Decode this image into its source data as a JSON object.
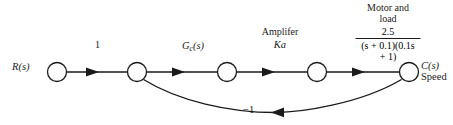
{
  "figure": {
    "type": "signal-flow-graph",
    "background_color": "#ffffff",
    "line_color": "#1a1a1a",
    "width": 453,
    "height": 125
  },
  "nodes": [
    {
      "id": "input",
      "label": "R(s)",
      "cx": 57,
      "cy": 72,
      "r": 9.5
    },
    {
      "id": "summing",
      "label": "",
      "cx": 137,
      "cy": 72,
      "r": 9.5
    },
    {
      "id": "controller",
      "label": "",
      "cx": 227,
      "cy": 72,
      "r": 9.5
    },
    {
      "id": "amplifier",
      "label": "",
      "cx": 317,
      "cy": 72,
      "r": 9.5
    },
    {
      "id": "output",
      "label": "C(s)",
      "cx": 409,
      "cy": 72,
      "r": 9.5
    }
  ],
  "labels": {
    "input": "R(s)",
    "output": "C(s)",
    "output_sub": "Speed",
    "gain_unity": "1",
    "gain_controller_main": "G",
    "gain_controller_sub": "c",
    "gain_controller_tail": "(s)",
    "amplifier_title": "Amplifer",
    "amplifier_gain": "Ka",
    "motor_title_line1": "Motor and",
    "motor_title_line2": "load",
    "motor_numerator": "2.5",
    "motor_denominator": "(s + 0.1)(0.1s + 1)",
    "feedback_gain": "−1"
  },
  "branches": [
    {
      "from": "input",
      "to": "summing",
      "gain": "1",
      "direction": "forward"
    },
    {
      "from": "summing",
      "to": "controller",
      "gain": "G_c(s)",
      "direction": "forward"
    },
    {
      "from": "controller",
      "to": "amplifier",
      "gain": "Ka",
      "direction": "forward"
    },
    {
      "from": "amplifier",
      "to": "output",
      "gain": "2.5/((s + 0.1)(0.1s + 1))",
      "direction": "forward"
    },
    {
      "from": "output",
      "to": "summing",
      "gain": "−1",
      "direction": "feedback"
    }
  ]
}
